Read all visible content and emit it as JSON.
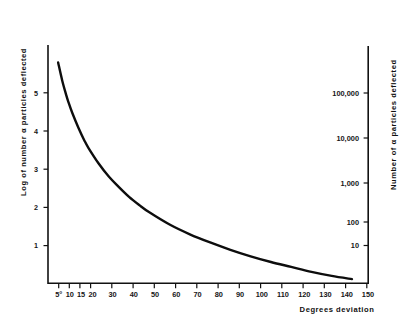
{
  "chart_data": {
    "type": "line",
    "title": "",
    "subtitle": "",
    "xlabel": "Degrees deviation",
    "ylabel": "Log of number α particles deflected",
    "y2label": "Number of α particles deflected",
    "xlim": [
      0,
      158
    ],
    "ylim": [
      0,
      5.85
    ],
    "y2lim": [
      1,
      1000000
    ],
    "y2scale": "log",
    "grid": false,
    "legend": null,
    "x_tick_labels": [
      "5°",
      "10",
      "15",
      "20",
      "30",
      "40",
      "50",
      "60",
      "70",
      "80",
      "90",
      "100",
      "110",
      "120",
      "130",
      "140",
      "150"
    ],
    "x_tick_values": [
      5,
      10,
      15,
      20,
      30,
      40,
      50,
      60,
      70,
      80,
      90,
      100,
      110,
      120,
      130,
      140,
      150
    ],
    "y_tick_labels": [
      "1",
      "2",
      "3",
      "4",
      "5"
    ],
    "y_tick_values": [
      1,
      2,
      3,
      4,
      5
    ],
    "y2_tick_labels": [
      "10",
      "100",
      "1,000",
      "10,000",
      "100,000"
    ],
    "y2_tick_values": [
      10,
      100,
      1000,
      10000,
      100000
    ],
    "series": [
      {
        "name": "alpha particle scattering",
        "x": [
          5,
          7,
          9,
          10,
          12,
          15,
          18,
          20,
          25,
          30,
          35,
          40,
          45,
          50,
          60,
          70,
          80,
          90,
          100,
          110,
          120,
          130,
          140,
          150
        ],
        "y": [
          5.42,
          4.98,
          4.62,
          4.46,
          4.18,
          3.82,
          3.5,
          3.32,
          2.94,
          2.62,
          2.36,
          2.12,
          1.92,
          1.74,
          1.44,
          1.2,
          1.0,
          0.82,
          0.66,
          0.52,
          0.4,
          0.28,
          0.18,
          0.1
        ]
      }
    ]
  },
  "colors": {
    "curve": "#0d0d0d",
    "axis": "#111111",
    "background": "#ffffff",
    "text": "#161616"
  }
}
